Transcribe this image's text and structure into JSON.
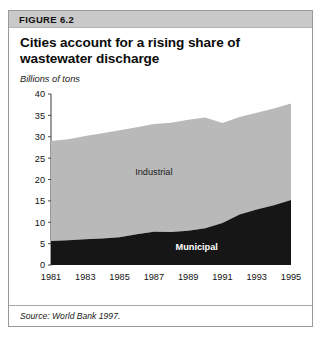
{
  "figure": {
    "band_label": "FIGURE 6.2",
    "title": "Cities account for a rising share of wastewater discharge",
    "unit_label": "Billions of tons",
    "source": "Source: World Bank 1997."
  },
  "colors": {
    "band": "#c9c9c9",
    "card_border": "#9a9a9a",
    "industrial": "#b9b9b9",
    "municipal": "#161616",
    "axis": "#4a4a4a",
    "text": "#111111"
  },
  "chart_data": {
    "type": "area",
    "stacked": true,
    "title": "Cities account for a rising share of wastewater discharge",
    "xlabel": "",
    "ylabel": "Billions of tons",
    "ylim": [
      0,
      40
    ],
    "xlim": [
      1981,
      1995
    ],
    "yticks": [
      0,
      5,
      10,
      15,
      20,
      25,
      30,
      35,
      40
    ],
    "xticks": [
      1981,
      1983,
      1985,
      1987,
      1989,
      1991,
      1993,
      1995
    ],
    "grid": false,
    "legend": "inline-annotations",
    "x": [
      1981,
      1982,
      1983,
      1984,
      1985,
      1986,
      1987,
      1988,
      1989,
      1990,
      1991,
      1992,
      1993,
      1994,
      1995
    ],
    "series": [
      {
        "name": "Municipal",
        "color": "#161616",
        "values": [
          5.6,
          5.8,
          6.0,
          6.2,
          6.5,
          7.2,
          7.8,
          7.7,
          8.0,
          8.6,
          9.8,
          11.8,
          13.0,
          14.0,
          15.2
        ]
      },
      {
        "name": "Industrial",
        "color": "#b9b9b9",
        "values": [
          23.4,
          23.6,
          24.2,
          24.6,
          25.0,
          25.0,
          25.2,
          25.6,
          26.0,
          25.9,
          23.4,
          22.8,
          22.6,
          22.6,
          22.6
        ]
      }
    ],
    "totals": [
      29.0,
      29.4,
      30.2,
      30.8,
      31.5,
      32.2,
      33.0,
      33.3,
      34.0,
      34.5,
      33.2,
      34.6,
      35.6,
      36.6,
      37.8
    ],
    "annotations": [
      {
        "text": "Industrial",
        "x": 1987,
        "y": 21.0
      },
      {
        "text": "Municipal",
        "x": 1989.5,
        "y": 3.4
      }
    ]
  }
}
